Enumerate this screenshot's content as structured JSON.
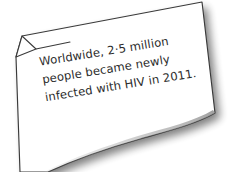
{
  "scene": {
    "kind": "paper-note-illustration",
    "background_color": "#ffffff",
    "paper_color": "#ffffff",
    "outline_color": "#3a3a3a",
    "shadow_color": "#9a9a9a",
    "text_color": "#2b2b2b",
    "rotation_degrees": -9.2
  },
  "note": {
    "lines": [
      "Worldwide, 2·5 million",
      "people became newly",
      "infected with HIV in 2011."
    ],
    "full_text": "Worldwide, 2·5 million people became newly infected with HIV in 2011.",
    "statistic_value": "2·5 million",
    "subject": "people newly infected with HIV",
    "year": "2011",
    "scope": "Worldwide"
  },
  "decorations": {
    "folded_corner": "top-left dog-ear fold",
    "bottom_edge": "curled wavy edge",
    "drop_shadow": "soft gray shadow to lower-right"
  }
}
